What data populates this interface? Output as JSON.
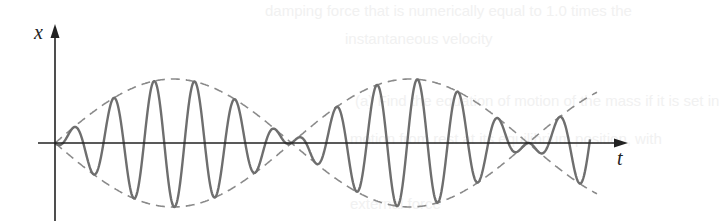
{
  "figure": {
    "type": "beat-oscillation-diagram",
    "x_axis_label": "t",
    "y_axis_label": "x",
    "colors": {
      "axes": "#222222",
      "signal": "#6e6e6e",
      "envelope": "#8a8a8a",
      "background": "#ffffff"
    }
  },
  "ghost_text": {
    "line1": "damping force that is numerically equal to 1.0 times the",
    "line2": "instantaneous velocity",
    "line3": "(a) Find the equation of motion of the mass if it is set in",
    "line4": "motion from rest at its equilibrium position, with",
    "line5": "external force"
  }
}
